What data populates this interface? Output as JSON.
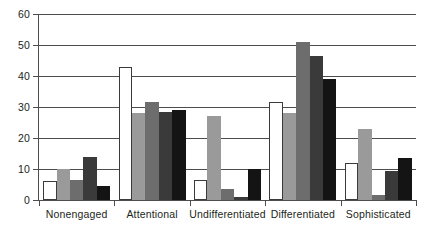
{
  "chart_data": {
    "type": "bar",
    "title": "",
    "subtitle": "",
    "xlabel": "",
    "ylabel": "",
    "categories": [
      "Nonengaged",
      "Attentional",
      "Undifferentiated",
      "Differentiated",
      "Sophisticated"
    ],
    "series": [
      {
        "name": "Series 1",
        "color": "#ffffff",
        "values": [
          6,
          43,
          6.5,
          31.5,
          12
        ]
      },
      {
        "name": "Series 2",
        "color": "#9a9a9a",
        "values": [
          10,
          28,
          27,
          28,
          23
        ]
      },
      {
        "name": "Series 3",
        "color": "#6d6d6d",
        "values": [
          6.5,
          31.5,
          3.5,
          51,
          1.5
        ]
      },
      {
        "name": "Series 4",
        "color": "#3a3a3a",
        "values": [
          14,
          28.5,
          1,
          46.5,
          9.5
        ]
      },
      {
        "name": "Series 5",
        "color": "#141414",
        "values": [
          4.5,
          29,
          10,
          39,
          13.5
        ]
      }
    ],
    "ylim": [
      0,
      60
    ],
    "yticks": [
      0,
      10,
      20,
      30,
      40,
      50,
      60
    ],
    "ytick_labels": [
      "0",
      "10",
      "20",
      "30",
      "40",
      "50",
      "60"
    ],
    "grid": true,
    "grid_axis": "y",
    "legend": "none",
    "legend_position": "none",
    "axis_color": "#4d4d4d",
    "text_color": "#231f20",
    "background": "#ffffff"
  }
}
